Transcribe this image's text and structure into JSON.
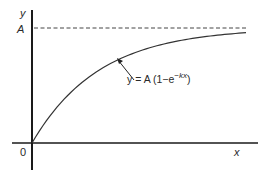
{
  "chart_data": {
    "type": "line",
    "title": "",
    "xlabel": "x",
    "ylabel": "y",
    "origin_label": "0",
    "asymptote_label": "A",
    "asymptote_style": "dashed",
    "annotation": {
      "prefix": "y = A (1−e",
      "exponent": "−kx",
      "suffix": ")"
    },
    "function": "y = A(1 - e^(-kx))",
    "params": {
      "A": 1,
      "k": 3.2
    },
    "xlim": [
      0,
      1.05
    ],
    "ylim": [
      -0.25,
      1.15
    ],
    "series": [
      {
        "name": "y = A(1 - e^(-kx))",
        "x_range": [
          0,
          1
        ],
        "samples": 60
      }
    ],
    "grid": false,
    "legend": "none",
    "colors": {
      "axis": "#1a1a1a",
      "curve": "#333333",
      "asymptote": "#444444"
    }
  }
}
